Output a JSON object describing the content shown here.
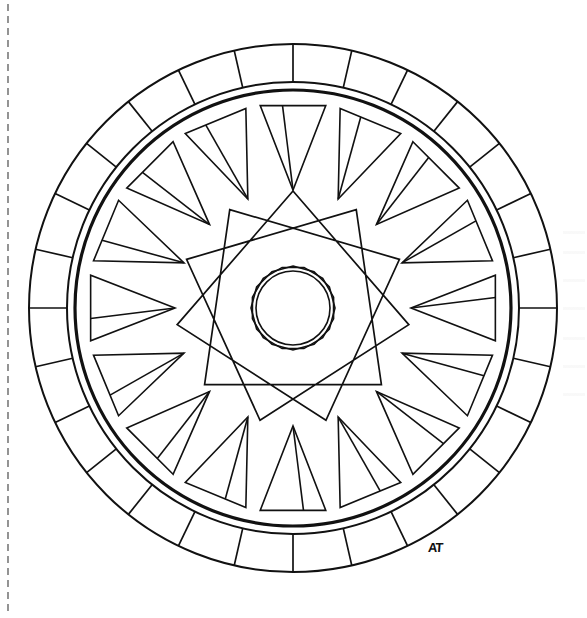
{
  "page": {
    "background_color": "#ffffff",
    "width": 587,
    "height": 618,
    "line_color": "#111111",
    "artwork_type": "line-art coloring page"
  },
  "perforation": {
    "name": "tear-off dashed line",
    "orientation": "vertical",
    "x": 8,
    "y_start": 4,
    "y_end": 616,
    "dash_length": 7,
    "gap_length": 5,
    "color": "#4d4d4d",
    "stroke_width": 1.2
  },
  "mandala": {
    "center_x": 293,
    "center_y": 308,
    "description": "Concentric wheel mandala: segmented outer band, ring of sixteen tapered wedges, an eleven-point interlaced star, and a central polygon rosette.",
    "rings": [
      {
        "name": "outer-band",
        "outer_radius": 264,
        "inner_radius": 226,
        "segment_count": 28,
        "segment_start_angle": -90,
        "stroke_width": 2.0
      },
      {
        "name": "heavy-inner-circle",
        "radius": 218,
        "stroke_width": 3.2
      },
      {
        "name": "wedge-ring",
        "wedge_count": 16,
        "wedge_outer_radius": 205,
        "wedge_inner_radius": 118,
        "wedge_half_angle": 9.2,
        "wedge_start_angle": -90,
        "stroke_width": 1.6,
        "has_internal_divider": true,
        "divider_offset_ratio": 0.34
      },
      {
        "name": "star-polygon",
        "points": 11,
        "step": 3,
        "outer_radius": 117,
        "start_angle": -90,
        "stroke_width": 1.7
      },
      {
        "name": "center-circle",
        "radius": 37,
        "stroke_width": 1.6
      },
      {
        "name": "center-rosette-polygon-a",
        "sides": 12,
        "radius": 42,
        "rotation": 0,
        "stroke_width": 1.6
      },
      {
        "name": "center-rosette-polygon-b",
        "sides": 12,
        "radius": 42,
        "rotation": 15,
        "stroke_width": 1.6
      }
    ]
  },
  "signature": {
    "text": "AT",
    "x": 428,
    "y": 540,
    "description": "artist monogram initials at lower right of the mandala band"
  },
  "chart_data": {
    "type": "pie",
    "categories": [
      "outer band segments",
      "wedge triangles",
      "star points",
      "rosette polygon sides"
    ],
    "values": [
      28,
      16,
      11,
      12
    ],
    "xlabel": "",
    "ylabel": "",
    "legend_position": "none"
  }
}
